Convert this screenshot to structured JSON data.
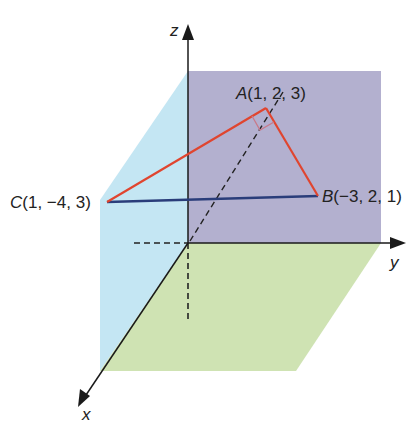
{
  "diagram": {
    "axes": {
      "x": {
        "label": "x"
      },
      "y": {
        "label": "y"
      },
      "z": {
        "label": "z"
      }
    },
    "points": {
      "A": {
        "name": "A",
        "coords": "(1, 2, 3)"
      },
      "B": {
        "name": "B",
        "coords": "(−3, 2, 1)"
      },
      "C": {
        "name": "C",
        "coords": "(1, −4, 3)"
      }
    },
    "colors": {
      "xz_plane": "#c4e6f3",
      "yz_plane": "#b3b0cf",
      "xy_plane": "#cfe3b3",
      "triangle_edges": "#e0452f",
      "edge_CB": "#2a3d7a",
      "axis": "#1a1a1a"
    },
    "annotations": {
      "right_angle_at": "A"
    }
  }
}
